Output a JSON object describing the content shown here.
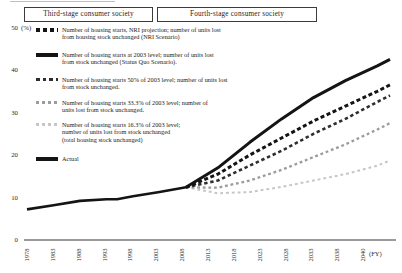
{
  "figure": {
    "stages": [
      {
        "label": "Third-stage consumer society"
      },
      {
        "label": "Fourth-stage consumer society"
      }
    ]
  },
  "y_axis": {
    "unit": "(%)",
    "ticks": [
      {
        "label": "50",
        "value": 50
      },
      {
        "label": "40",
        "value": 40
      },
      {
        "label": "30",
        "value": 30
      },
      {
        "label": "20",
        "value": 20
      },
      {
        "label": "10",
        "value": 10
      },
      {
        "label": "0",
        "value": 0
      }
    ]
  },
  "x_axis": {
    "ticks": [
      "1978",
      "1983",
      "1988",
      "1993",
      "1998",
      "2003",
      "2008",
      "2013",
      "2018",
      "2023",
      "2028",
      "2033",
      "2038",
      "2040"
    ],
    "fy_label": "(FY)"
  },
  "legend": {
    "items": [
      {
        "id": "nri",
        "top": 26,
        "lines": [
          "Number of housing starts, NRI projection; number of units lost",
          "from housing stock unchanged (NRI Scenario)"
        ],
        "marker": {
          "type": "dashed",
          "color": "#141414",
          "height": 3.5,
          "dash": 4,
          "gap": 3
        }
      },
      {
        "id": "status_quo",
        "top": 51,
        "lines": [
          "Number of housing starts at 2003 level; number of units lost",
          "from stock unchanged (Status Quo Scenario)."
        ],
        "marker": {
          "type": "solid",
          "color": "#141414",
          "height": 3.5
        }
      },
      {
        "id": "p50",
        "top": 76,
        "lines": [
          "Number of housing starts 50% of 2003 level; number of units lost",
          "from stock unchanged."
        ],
        "marker": {
          "type": "dashed",
          "color": "#2e2e2e",
          "height": 3,
          "dash": 3.5,
          "gap": 3
        }
      },
      {
        "id": "p333",
        "top": 99,
        "lines": [
          "Number of housing starts 33.3% of 2003 level; number of",
          "units lost from stock unchanged."
        ],
        "marker": {
          "type": "dashed",
          "color": "#9b9b9b",
          "height": 3,
          "dash": 3,
          "gap": 3
        }
      },
      {
        "id": "p163",
        "top": 121,
        "lines": [
          "Number of housing starts 16.3% of 2003 level;",
          "number of units lost from stock unchanged",
          "(total housing stock unchanged)"
        ],
        "marker": {
          "type": "dashed",
          "color": "#c6c6c6",
          "height": 2.5,
          "dash": 3,
          "gap": 3
        }
      },
      {
        "id": "actual",
        "top": 155,
        "lines": [
          "Actual"
        ],
        "marker": {
          "type": "solid",
          "color": "#141414",
          "height": 3.5
        }
      }
    ]
  },
  "chart_data": {
    "type": "line",
    "ylabel": "(%)",
    "xlabel": "(FY)",
    "ylim": [
      0,
      50
    ],
    "x_ticks": [
      "1978",
      "1983",
      "1988",
      "1993",
      "1998",
      "2003",
      "2008",
      "2013",
      "2018",
      "2023",
      "2028",
      "2033",
      "2038",
      "2040"
    ],
    "grid": false,
    "legend_position": "upper-left",
    "series": [
      {
        "id": "p163",
        "name": "Number of housing starts 16.3% of 2003 level; number of units lost from stock unchanged (total housing stock unchanged)",
        "color": "#c6c6c6",
        "width": 2,
        "dash": "2.8 3",
        "points": [
          [
            2008,
            12.4
          ],
          [
            2013,
            11.0
          ],
          [
            2018,
            11.3
          ],
          [
            2023,
            12.5
          ],
          [
            2028,
            14.0
          ],
          [
            2033,
            15.5
          ],
          [
            2038,
            17.5
          ],
          [
            2040,
            18.7
          ]
        ]
      },
      {
        "id": "p333",
        "name": "Number of housing starts 33.3% of 2003 level; number of units lost from stock unchanged",
        "color": "#9b9b9b",
        "width": 2.3,
        "dash": "2.8 2.8",
        "points": [
          [
            2008,
            12.4
          ],
          [
            2013,
            12.3
          ],
          [
            2018,
            14.0
          ],
          [
            2023,
            16.5
          ],
          [
            2028,
            19.5
          ],
          [
            2033,
            22.5
          ],
          [
            2038,
            26.0
          ],
          [
            2040,
            27.5
          ]
        ]
      },
      {
        "id": "p50",
        "name": "Number of housing starts 50% of 2003 level; number of units lost from stock unchanged",
        "color": "#2e2e2e",
        "width": 2.6,
        "dash": "3.4 2.8",
        "points": [
          [
            2008,
            12.4
          ],
          [
            2013,
            14.0
          ],
          [
            2018,
            17.5
          ],
          [
            2023,
            21.0
          ],
          [
            2028,
            25.0
          ],
          [
            2033,
            28.5
          ],
          [
            2038,
            32.5
          ],
          [
            2040,
            34.0
          ]
        ]
      },
      {
        "id": "nri",
        "name": "Number of housing starts, NRI projection; number of units lost from housing stock unchanged (NRI Scenario)",
        "color": "#141414",
        "width": 3,
        "dash": "4 2.6",
        "points": [
          [
            2008,
            12.4
          ],
          [
            2013,
            15.5
          ],
          [
            2018,
            20.0
          ],
          [
            2023,
            24.0
          ],
          [
            2028,
            28.0
          ],
          [
            2033,
            31.5
          ],
          [
            2038,
            35.0
          ],
          [
            2040,
            36.5
          ]
        ]
      },
      {
        "id": "status_quo",
        "name": "Number of housing starts at 2003 level; number of units lost from stock unchanged (Status Quo Scenario)",
        "color": "#141414",
        "width": 3,
        "dash": null,
        "points": [
          [
            2008,
            12.4
          ],
          [
            2013,
            17.0
          ],
          [
            2018,
            23.0
          ],
          [
            2023,
            28.5
          ],
          [
            2028,
            33.5
          ],
          [
            2033,
            37.5
          ],
          [
            2038,
            41.0
          ],
          [
            2040,
            42.5
          ]
        ]
      },
      {
        "id": "actual",
        "name": "Actual",
        "color": "#141414",
        "width": 2.6,
        "dash": null,
        "points": [
          [
            1978,
            7.2
          ],
          [
            1983,
            8.2
          ],
          [
            1988,
            9.2
          ],
          [
            1993,
            9.6
          ],
          [
            1995,
            9.6
          ],
          [
            1998,
            10.3
          ],
          [
            2003,
            11.3
          ],
          [
            2008,
            12.4
          ]
        ]
      }
    ]
  }
}
